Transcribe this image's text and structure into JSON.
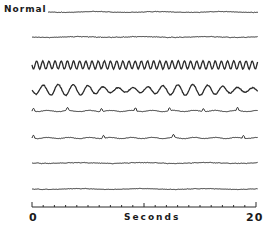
{
  "chart_data": {
    "type": "line",
    "title": "",
    "row_label": "Normal",
    "xlabel": "Seconds",
    "xlim": [
      0,
      20
    ],
    "x_ticks": [
      "0",
      "20"
    ],
    "minor_tick_step": 1,
    "grid": false,
    "legend": "none",
    "series": [
      {
        "name": "trace-1",
        "label": "Normal",
        "y_px": 12,
        "amp": 0.6,
        "freq": 3.0,
        "pattern": "low-amplitude fast"
      },
      {
        "name": "trace-2",
        "label": "",
        "y_px": 37,
        "amp": 0.7,
        "freq": 3.0,
        "pattern": "low-amplitude fast"
      },
      {
        "name": "trace-3",
        "label": "",
        "y_px": 65,
        "amp": 4.0,
        "freq": 9.0,
        "pattern": "high-amplitude rhythmic"
      },
      {
        "name": "trace-4",
        "label": "",
        "y_px": 90,
        "amp": 5.5,
        "freq": 3.5,
        "pattern": "slow large waves"
      },
      {
        "name": "trace-5",
        "label": "",
        "y_px": 111,
        "amp": 1.2,
        "freq": 1.5,
        "pattern": "intermittent spikes"
      },
      {
        "name": "trace-6",
        "label": "",
        "y_px": 138,
        "amp": 0.8,
        "freq": 1.0,
        "pattern": "sparse spikes"
      },
      {
        "name": "trace-7",
        "label": "",
        "y_px": 163,
        "amp": 0.7,
        "freq": 1.0,
        "pattern": "near-flat with one spike"
      },
      {
        "name": "trace-8",
        "label": "",
        "y_px": 189,
        "amp": 0.5,
        "freq": 1.0,
        "pattern": "near-flat"
      }
    ]
  },
  "axis": {
    "start_label": "0",
    "end_label": "20",
    "title": "Seconds"
  }
}
